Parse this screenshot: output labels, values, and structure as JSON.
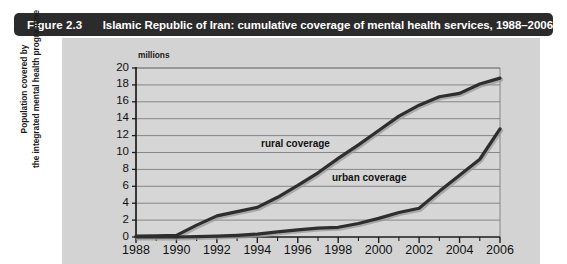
{
  "caption": {
    "figure_number": "Figure 2.3",
    "title": "Islamic Republic of Iran: cumulative coverage of mental health services, 1988–2006",
    "bar_color": "#2b2b2b",
    "text_color": "#ffffff"
  },
  "panel": {
    "background_color": "#d3d3d3"
  },
  "axes": {
    "y_axis_title_line1": "Population covered by",
    "y_axis_title_line2": "the integrated mental health programme",
    "y_units": "millions"
  },
  "chart_data": {
    "type": "line",
    "title": "Islamic Republic of Iran: cumulative coverage of mental health services, 1988–2006",
    "subtitle": "",
    "xlabel": "",
    "ylabel": "Population covered by the integrated mental health programme",
    "y_units": "millions",
    "xlim": [
      1988,
      2006
    ],
    "ylim": [
      0,
      20
    ],
    "xticks": [
      1988,
      1990,
      1992,
      1994,
      1996,
      1998,
      2000,
      2002,
      2004,
      2006
    ],
    "xtick_labels": [
      "1988",
      "1990",
      "1992",
      "1994",
      "1996",
      "1998",
      "2000",
      "2002",
      "2004",
      "2006"
    ],
    "x_minor_ticks": [
      1989,
      1991,
      1993,
      1995,
      1997,
      1999,
      2001,
      2003,
      2005
    ],
    "yticks": [
      0,
      2,
      4,
      6,
      8,
      10,
      12,
      14,
      16,
      18,
      20
    ],
    "ytick_labels": [
      "0",
      "2",
      "4",
      "6",
      "8",
      "10",
      "12",
      "14",
      "16",
      "18",
      "20"
    ],
    "grid": "horizontal",
    "legend_position": "inline-annotations",
    "line_color": "#2e2e2e",
    "x": [
      1988,
      1989,
      1990,
      1991,
      1992,
      1993,
      1994,
      1995,
      1996,
      1997,
      1998,
      1999,
      2000,
      2001,
      2002,
      2003,
      2004,
      2005,
      2006
    ],
    "series": [
      {
        "name": "rural coverage",
        "label": "rural coverage",
        "values": [
          0.1,
          0.15,
          0.2,
          1.4,
          2.5,
          3.0,
          3.5,
          4.7,
          6.1,
          7.6,
          9.3,
          10.9,
          12.6,
          14.3,
          15.6,
          16.6,
          17.0,
          18.1,
          18.8
        ]
      },
      {
        "name": "urban coverage",
        "label": "urban coverage",
        "values": [
          0.0,
          0.0,
          0.0,
          0.05,
          0.1,
          0.2,
          0.35,
          0.6,
          0.85,
          1.05,
          1.15,
          1.6,
          2.2,
          2.9,
          3.4,
          5.4,
          7.3,
          9.2,
          12.8
        ]
      }
    ]
  }
}
